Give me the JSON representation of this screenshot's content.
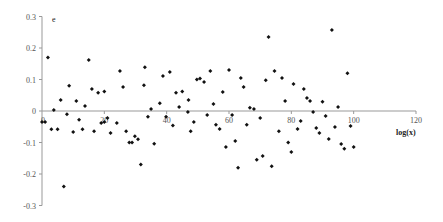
{
  "chart_data": {
    "type": "scatter",
    "title": "",
    "xlabel": "log(x)",
    "ylabel": "e",
    "xlim": [
      0,
      120
    ],
    "ylim": [
      -0.3,
      0.3
    ],
    "x_ticks": [
      0,
      20,
      40,
      60,
      80,
      100,
      120
    ],
    "x_tick_labels": [
      "0",
      "20",
      "40",
      "60",
      "80",
      "100",
      "120"
    ],
    "y_ticks": [
      0.3,
      0.2,
      0.1,
      0,
      -0.1,
      -0.2,
      -0.3
    ],
    "y_tick_labels": [
      "0.3",
      "0.2",
      "0.1",
      "0",
      "-0.1",
      "-0.2",
      "-0.3"
    ],
    "grid": false,
    "legend": null,
    "marker": "diamond",
    "marker_color": "#111111",
    "axis_color": "#999999",
    "points": [
      [
        0,
        -0.035
      ],
      [
        1,
        -0.035
      ],
      [
        1.9,
        0.17
      ],
      [
        3,
        -0.058
      ],
      [
        3.8,
        0.003
      ],
      [
        5,
        -0.058
      ],
      [
        6,
        0.035
      ],
      [
        7,
        -0.24
      ],
      [
        8,
        -0.01
      ],
      [
        8.7,
        0.08
      ],
      [
        10,
        -0.067
      ],
      [
        11,
        0.032
      ],
      [
        11.9,
        -0.028
      ],
      [
        13,
        -0.058
      ],
      [
        13.8,
        0.016
      ],
      [
        15,
        0.162
      ],
      [
        16,
        0.07
      ],
      [
        16.7,
        -0.064
      ],
      [
        18,
        0.058
      ],
      [
        19,
        -0.038
      ],
      [
        20,
        0.062
      ],
      [
        20,
        -0.035
      ],
      [
        21,
        -0.022
      ],
      [
        22,
        -0.07
      ],
      [
        24,
        -0.038
      ],
      [
        25,
        0.127
      ],
      [
        26,
        0.076
      ],
      [
        27,
        -0.064
      ],
      [
        28,
        -0.1
      ],
      [
        28.9,
        -0.1
      ],
      [
        29.8,
        -0.08
      ],
      [
        30.8,
        -0.09
      ],
      [
        31.7,
        -0.17
      ],
      [
        32.7,
        0.082
      ],
      [
        33,
        0.139
      ],
      [
        34,
        -0.018
      ],
      [
        35,
        0.006
      ],
      [
        36,
        -0.104
      ],
      [
        37.8,
        0.025
      ],
      [
        38.8,
        0.111
      ],
      [
        39.8,
        -0.018
      ],
      [
        41,
        0.124
      ],
      [
        42,
        -0.046
      ],
      [
        43,
        0.058
      ],
      [
        44,
        0.013
      ],
      [
        45,
        0.062
      ],
      [
        46.8,
        -0.003
      ],
      [
        47,
        0.035
      ],
      [
        47.7,
        -0.064
      ],
      [
        48.7,
        -0.035
      ],
      [
        49.7,
        0.1
      ],
      [
        50.7,
        0.103
      ],
      [
        52,
        0.092
      ],
      [
        53,
        -0.013
      ],
      [
        54,
        0.127
      ],
      [
        55,
        0.022
      ],
      [
        55.8,
        -0.044
      ],
      [
        57,
        -0.057
      ],
      [
        58,
        0.06
      ],
      [
        59,
        -0.114
      ],
      [
        60,
        0.13
      ],
      [
        61,
        -0.013
      ],
      [
        62,
        -0.095
      ],
      [
        62.9,
        -0.18
      ],
      [
        63.8,
        0.105
      ],
      [
        64.7,
        0.076
      ],
      [
        65.7,
        -0.044
      ],
      [
        66.7,
        0.01
      ],
      [
        68,
        0.006
      ],
      [
        68.9,
        -0.155
      ],
      [
        70,
        -0.022
      ],
      [
        70.8,
        -0.143
      ],
      [
        71.8,
        0.098
      ],
      [
        72.7,
        0.235
      ],
      [
        73.7,
        -0.175
      ],
      [
        74.6,
        0.127
      ],
      [
        76,
        -0.064
      ],
      [
        77,
        0.105
      ],
      [
        78,
        0.032
      ],
      [
        79,
        -0.1
      ],
      [
        80,
        -0.13
      ],
      [
        80.7,
        0.086
      ],
      [
        82,
        -0.057
      ],
      [
        83,
        -0.032
      ],
      [
        84,
        0.07
      ],
      [
        85,
        0.041
      ],
      [
        86,
        0.032
      ],
      [
        87,
        -0.003
      ],
      [
        88,
        -0.054
      ],
      [
        89,
        -0.07
      ],
      [
        90,
        0.029
      ],
      [
        91,
        -0.016
      ],
      [
        92,
        -0.089
      ],
      [
        93,
        0.257
      ],
      [
        94,
        -0.051
      ],
      [
        95,
        0.013
      ],
      [
        96,
        -0.105
      ],
      [
        97,
        -0.12
      ],
      [
        98,
        0.12
      ],
      [
        99,
        -0.048
      ],
      [
        100,
        -0.114
      ]
    ]
  }
}
